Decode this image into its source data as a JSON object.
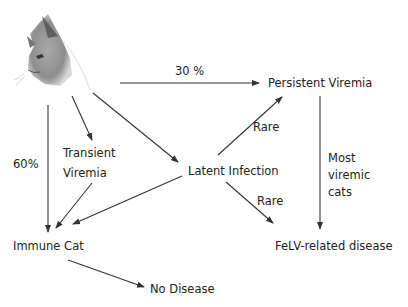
{
  "diagram": {
    "nodes": {
      "cat_image": "cat-illustration",
      "persistent_viremia": "Persistent Viremia",
      "transient_viremia_line1": "Transient",
      "transient_viremia_line2": "Viremia",
      "latent_infection": "Latent Infection",
      "immune_cat": "Immune Cat",
      "felv_disease": "FeLV-related disease",
      "no_disease": "No Disease"
    },
    "edge_labels": {
      "cat_to_persistent": "30 %",
      "cat_to_immune": "60%",
      "latent_to_persistent": "Rare",
      "latent_to_felv": "Rare",
      "persistent_to_felv_line1": "Most",
      "persistent_to_felv_line2": "viremic",
      "persistent_to_felv_line3": "cats"
    },
    "colors": {
      "line": "#333333",
      "text": "#222222"
    }
  }
}
